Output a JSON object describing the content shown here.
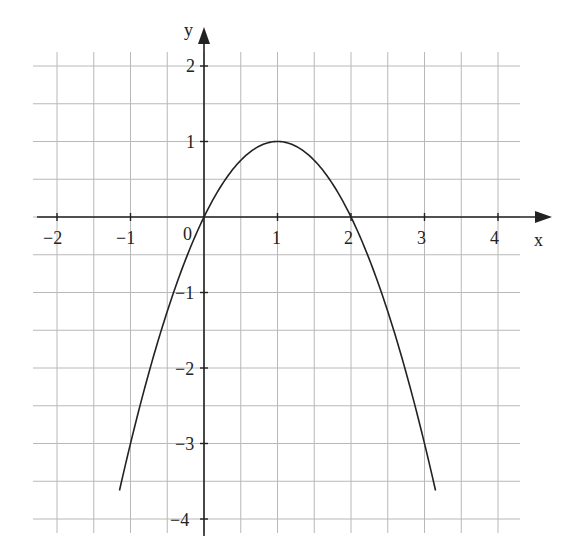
{
  "chart_data": {
    "type": "line",
    "title": "",
    "function": "y = -x^2 + 2x",
    "xlabel": "x",
    "ylabel": "y",
    "xlim": [
      -2.25,
      4.35
    ],
    "ylim": [
      -4.3,
      2.3
    ],
    "x_ticks": [
      -2,
      -1,
      0,
      1,
      2,
      3,
      4
    ],
    "x_tick_labels": [
      "−2",
      "−1",
      "0",
      "1",
      "2",
      "3",
      "4"
    ],
    "y_ticks": [
      2,
      1,
      -1,
      -2,
      -3,
      -4
    ],
    "y_tick_labels": [
      "2",
      "1",
      "−1",
      "−2",
      "−3",
      "−4"
    ],
    "origin_label": "0",
    "grid": true,
    "grid_step": 0.5,
    "legend": "none",
    "series": [
      {
        "name": "parabola",
        "x": [
          -1.15,
          -1,
          -0.5,
          0,
          0.5,
          1,
          1.5,
          2,
          2.5,
          3,
          3.15
        ],
        "y": [
          -3.62,
          -3,
          -1.25,
          0,
          0.75,
          1,
          0.75,
          0,
          -1.25,
          -3,
          -3.62
        ]
      }
    ],
    "key_points": {
      "vertex": [
        1,
        1
      ],
      "roots": [
        0,
        2
      ]
    }
  },
  "colors": {
    "curve": "#222222",
    "axis": "#222222",
    "grid": "#b8b8b8",
    "background": "#ffffff"
  },
  "labels": {
    "x_axis": "x",
    "y_axis": "y",
    "origin": "0",
    "x_ticks": [
      "−2",
      "−1",
      "1",
      "2",
      "3",
      "4"
    ],
    "y_ticks": [
      "2",
      "1",
      "−1",
      "−2",
      "−3",
      "−4"
    ]
  }
}
